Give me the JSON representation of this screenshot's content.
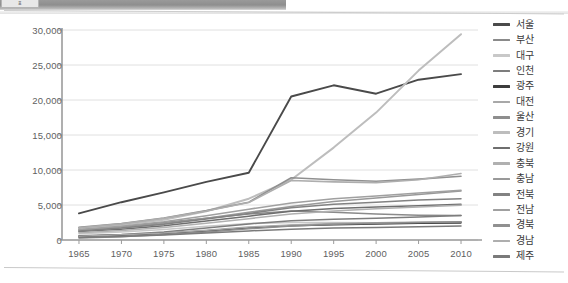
{
  "window": {
    "toolbar_tab_label": "표",
    "has_top_divider": true,
    "has_bottom_divider": true
  },
  "chart_data": {
    "type": "line",
    "title": "",
    "subtitle": "",
    "xlabel": "",
    "ylabel": "",
    "x": [
      1965,
      1970,
      1975,
      1980,
      1985,
      1990,
      1995,
      2000,
      2005,
      2010
    ],
    "xtick_labels": [
      "1965",
      "1970",
      "1975",
      "1980",
      "1985",
      "1990",
      "1995",
      "2000",
      "2005",
      "2010"
    ],
    "xlim": [
      1963,
      2012
    ],
    "ylim": [
      0,
      30000
    ],
    "ytick_values": [
      0,
      5000,
      10000,
      15000,
      20000,
      25000,
      30000
    ],
    "ytick_labels": [
      "0",
      "5,000",
      "10,000",
      "15,000",
      "20,000",
      "25,000",
      "30,000"
    ],
    "grid": true,
    "grid_axis": "y",
    "legend_position": "right",
    "series": [
      {
        "name": "서울",
        "color": "#4a4a4a",
        "width": 1.9,
        "values": [
          3800,
          5400,
          6800,
          8300,
          9600,
          20500,
          22100,
          20900,
          22900,
          23700
        ]
      },
      {
        "name": "부산",
        "color": "#8a8a8a",
        "width": 1.5,
        "values": [
          1450,
          1900,
          2500,
          3100,
          3700,
          4150,
          3950,
          3700,
          3550,
          3500
        ]
      },
      {
        "name": "대구",
        "color": "#c8c8c8",
        "width": 1.5,
        "values": [
          900,
          1150,
          1500,
          1950,
          2350,
          2500,
          2500,
          2450,
          2500,
          2550
        ]
      },
      {
        "name": "인천",
        "color": "#7d7d7d",
        "width": 1.5,
        "values": [
          600,
          800,
          1150,
          1700,
          2300,
          2750,
          2950,
          3100,
          3300,
          3500
        ]
      },
      {
        "name": "광주",
        "color": "#3d3d3d",
        "width": 1.6,
        "values": [
          520,
          700,
          950,
          1300,
          1750,
          2050,
          2200,
          2300,
          2400,
          2450
        ]
      },
      {
        "name": "대전",
        "color": "#a8a8a8",
        "width": 1.5,
        "values": [
          550,
          750,
          1000,
          1400,
          1850,
          2150,
          2350,
          2450,
          2550,
          2600
        ]
      },
      {
        "name": "울산",
        "color": "#8e8e8e",
        "width": 1.5,
        "values": [
          300,
          480,
          780,
          1150,
          1600,
          2000,
          2250,
          2400,
          2500,
          2600
        ]
      },
      {
        "name": "경기",
        "color": "#bdbdbd",
        "width": 2.0,
        "values": [
          1700,
          2150,
          2900,
          4100,
          5900,
          8600,
          13200,
          18200,
          24200,
          29400
        ]
      },
      {
        "name": "강원",
        "color": "#6e6e6e",
        "width": 1.5,
        "values": [
          1200,
          1550,
          2050,
          2700,
          3400,
          4100,
          4500,
          4700,
          4900,
          5100
        ]
      },
      {
        "name": "충북",
        "color": "#b0b0b0",
        "width": 1.5,
        "values": [
          1050,
          1350,
          1800,
          2400,
          3050,
          3700,
          4150,
          4450,
          4700,
          4950
        ]
      },
      {
        "name": "충남",
        "color": "#999999",
        "width": 1.5,
        "values": [
          1350,
          1750,
          2350,
          3100,
          3950,
          4800,
          5500,
          6000,
          6500,
          7000
        ]
      },
      {
        "name": "전북",
        "color": "#828282",
        "width": 1.5,
        "values": [
          1300,
          1700,
          2250,
          3000,
          3800,
          4600,
          5100,
          5400,
          5700,
          5900
        ]
      },
      {
        "name": "전남",
        "color": "#a0a0a0",
        "width": 1.5,
        "values": [
          1500,
          1950,
          2600,
          3450,
          4400,
          5300,
          5900,
          6300,
          6700,
          7100
        ]
      },
      {
        "name": "경북",
        "color": "#909090",
        "width": 1.6,
        "values": [
          1800,
          2350,
          3150,
          4200,
          5400,
          8900,
          8600,
          8400,
          8700,
          9100
        ]
      },
      {
        "name": "경남",
        "color": "#aeaeae",
        "width": 1.6,
        "values": [
          1750,
          2300,
          3100,
          4150,
          5350,
          8500,
          8300,
          8200,
          8600,
          9500
        ]
      },
      {
        "name": "제주",
        "color": "#7a7a7a",
        "width": 1.5,
        "values": [
          350,
          500,
          720,
          1000,
          1300,
          1550,
          1700,
          1800,
          1900,
          2000
        ]
      }
    ]
  }
}
